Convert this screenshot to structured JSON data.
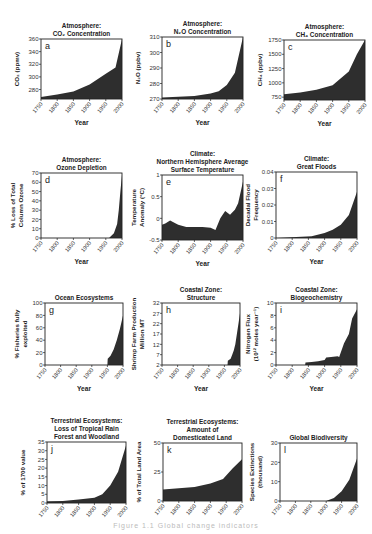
{
  "figure": {
    "caption": "Figure 1.1 Global change indicators",
    "fill_color": "#2e2e2e",
    "axis_color": "#222222",
    "x_axis": {
      "label": "Year",
      "ticks": [
        1750,
        1800,
        1850,
        1900,
        1950,
        2000
      ]
    }
  },
  "chart_data": [
    {
      "id": "a",
      "type": "area",
      "title": [
        "Atmosphere:",
        "CO₂ Concentration"
      ],
      "ylabel": [
        "CO₂ (ppmv)"
      ],
      "ylim": [
        265,
        360
      ],
      "yticks": [
        280,
        300,
        320,
        340,
        360
      ],
      "x": [
        1750,
        1800,
        1850,
        1900,
        1950,
        1980,
        2000
      ],
      "values": [
        268,
        272,
        277,
        288,
        305,
        315,
        360
      ],
      "xlabel": "Year"
    },
    {
      "id": "b",
      "type": "area",
      "title": [
        "Atmosphere:",
        "N₂O Concentration"
      ],
      "ylabel": [
        "N₂O (ppbv)"
      ],
      "ylim": [
        270,
        310
      ],
      "yticks": [
        270,
        280,
        290,
        300,
        310
      ],
      "x": [
        1750,
        1800,
        1850,
        1900,
        1925,
        1950,
        1975,
        2000
      ],
      "values": [
        271,
        271.5,
        272,
        273.5,
        275,
        279,
        287,
        310
      ],
      "xlabel": "Year"
    },
    {
      "id": "c",
      "type": "area",
      "title": [
        "Atmosphere:",
        "CH₄ Concentration"
      ],
      "ylabel": [
        "CH₄ (ppbv)"
      ],
      "ylim": [
        700,
        1750
      ],
      "yticks": [
        750,
        1000,
        1250,
        1500,
        1750
      ],
      "x": [
        1750,
        1800,
        1850,
        1900,
        1950,
        1975,
        2000
      ],
      "values": [
        800,
        830,
        880,
        960,
        1200,
        1500,
        1750
      ],
      "xlabel": "Year"
    },
    {
      "id": "d",
      "type": "area",
      "title": [
        "Atmosphere:",
        "Ozone Depletion"
      ],
      "ylabel": [
        "% Loss of Total",
        "Column Ozone"
      ],
      "ylim": [
        0,
        70
      ],
      "yticks": [
        0,
        10,
        20,
        30,
        40,
        50,
        60,
        70
      ],
      "x": [
        1750,
        1960,
        1975,
        1985,
        1990,
        1995,
        2000
      ],
      "values": [
        0,
        0,
        5,
        15,
        30,
        50,
        68
      ],
      "xlabel": "Year"
    },
    {
      "id": "e",
      "type": "area",
      "title": [
        "Climate:",
        "Northern Hemisphere Average",
        "Surface Temperature"
      ],
      "ylabel": [
        "Temperature",
        "Anomaly (°C)"
      ],
      "ylim": [
        -0.5,
        1.0
      ],
      "yticks": [
        -0.5,
        0,
        0.5,
        1.0
      ],
      "x": [
        1750,
        1760,
        1775,
        1800,
        1825,
        1850,
        1875,
        1900,
        1915,
        1930,
        1945,
        1960,
        1975,
        1985,
        2000
      ],
      "values": [
        -0.15,
        -0.12,
        -0.05,
        -0.15,
        -0.2,
        -0.2,
        -0.2,
        -0.22,
        -0.27,
        0.0,
        0.17,
        0.08,
        0.2,
        0.35,
        0.85
      ],
      "xlabel": "Year"
    },
    {
      "id": "f",
      "type": "area",
      "title": [
        "Climate:",
        "Great Floods"
      ],
      "ylabel": [
        "Decadal Flood",
        "Frequency"
      ],
      "ylim": [
        0,
        0.04
      ],
      "yticks": [
        0,
        0.01,
        0.02,
        0.03,
        0.04
      ],
      "x": [
        1750,
        1860,
        1900,
        1925,
        1950,
        1975,
        2000
      ],
      "values": [
        0,
        0.001,
        0.003,
        0.005,
        0.008,
        0.014,
        0.028
      ],
      "xlabel": "Year"
    },
    {
      "id": "g",
      "type": "area",
      "title": [
        "Ocean Ecosystems"
      ],
      "ylabel": [
        "% Fisheries fully",
        "exploited"
      ],
      "ylim": [
        0,
        100
      ],
      "yticks": [
        0,
        20,
        40,
        60,
        80,
        100
      ],
      "x": [
        1750,
        1950,
        1951,
        1960,
        1970,
        1980,
        1990,
        2000
      ],
      "values": [
        0,
        0,
        10,
        15,
        25,
        40,
        58,
        80
      ],
      "xlabel": "Year"
    },
    {
      "id": "h",
      "type": "area",
      "title": [
        "Coastal Zone:",
        "Structure"
      ],
      "ylabel": [
        "Shrimp Farm Production",
        "Million MT"
      ],
      "ylim": [
        2,
        32
      ],
      "yticks": [
        2,
        7,
        12,
        17,
        22,
        27,
        32
      ],
      "x": [
        1750,
        1960,
        1961,
        1970,
        1975,
        1980,
        1985,
        1990,
        1995,
        2000
      ],
      "values": [
        2,
        2,
        4,
        5,
        7,
        9,
        12,
        17,
        22,
        27
      ],
      "xlabel": "Year"
    },
    {
      "id": "i",
      "type": "area",
      "title": [
        "Coastal Zone:",
        "Biogeochemistry"
      ],
      "ylabel": [
        "Nitrogen Flux",
        "(10¹² moles year⁻¹)"
      ],
      "ylim": [
        0,
        10
      ],
      "yticks": [
        0,
        2,
        4,
        6,
        8,
        10
      ],
      "x": [
        1750,
        1840,
        1841,
        1860,
        1880,
        1900,
        1905,
        1920,
        1940,
        1945,
        1960,
        1975,
        1985,
        2000
      ],
      "values": [
        0,
        0,
        0.4,
        0.5,
        0.6,
        0.8,
        1.2,
        1.3,
        1.4,
        1.3,
        3.5,
        5.0,
        7.5,
        9.0
      ],
      "xlabel": "Year"
    },
    {
      "id": "j",
      "type": "area",
      "title": [
        "Terrestrial Ecosystems:",
        "Loss of Tropical Rain",
        "Forest and Woodland"
      ],
      "ylabel": [
        "% of 1700 value"
      ],
      "ylim": [
        0,
        35
      ],
      "yticks": [
        0,
        5,
        10,
        15,
        20,
        25,
        30,
        35
      ],
      "x": [
        1750,
        1800,
        1850,
        1900,
        1925,
        1950,
        1975,
        2000
      ],
      "values": [
        1,
        1.2,
        2,
        3,
        5,
        10,
        18,
        33
      ],
      "xlabel": ""
    },
    {
      "id": "k",
      "type": "area",
      "title": [
        "Terrestrial Ecosystems:",
        "Amount of",
        "Domesticated Land"
      ],
      "ylabel": [
        "% of Total Land Area"
      ],
      "ylim": [
        0,
        50
      ],
      "yticks": [
        0,
        25,
        50
      ],
      "x": [
        1750,
        1800,
        1850,
        1900,
        1940,
        1970,
        2000
      ],
      "values": [
        10,
        11,
        12,
        15,
        19,
        28,
        36
      ],
      "xlabel": ""
    },
    {
      "id": "l",
      "type": "area",
      "title": [
        "Global Biodiversity"
      ],
      "ylabel": [
        "Species Extinctions",
        "(thousand)"
      ],
      "ylim": [
        0,
        30
      ],
      "yticks": [
        0,
        10,
        20,
        30
      ],
      "x": [
        1750,
        1900,
        1925,
        1950,
        1975,
        2000
      ],
      "values": [
        0,
        0,
        1.5,
        5,
        11,
        22
      ],
      "xlabel": ""
    }
  ]
}
